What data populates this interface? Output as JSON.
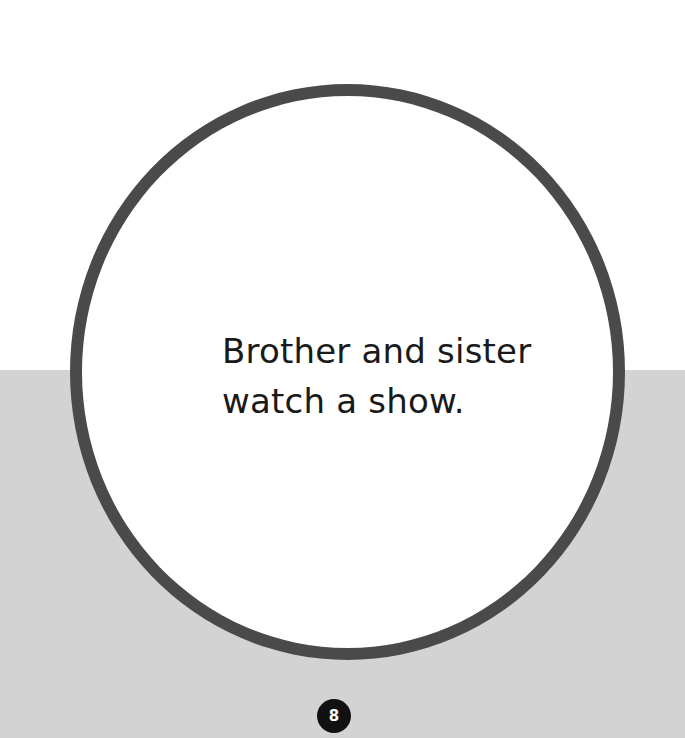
{
  "page": {
    "text_lines": [
      "Brother and sister",
      "watch a show."
    ],
    "page_number": "8"
  },
  "colors": {
    "background_top": "#ffffff",
    "background_bottom": "#d3d3d3",
    "circle_border": "#4a4a4a",
    "page_badge": "#111111"
  }
}
